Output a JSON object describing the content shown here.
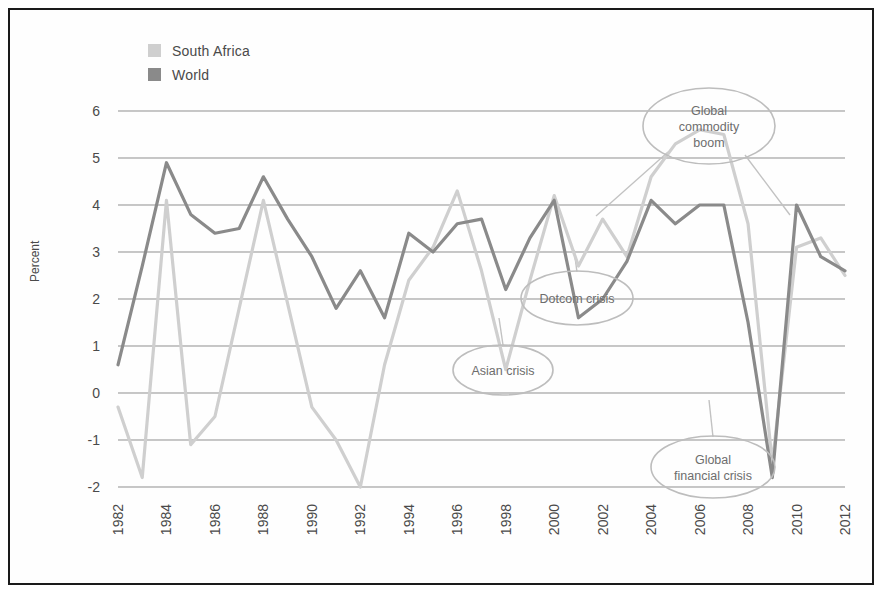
{
  "legend": {
    "items": [
      {
        "label": "South Africa",
        "color": "#cfcfcf"
      },
      {
        "label": "World",
        "color": "#8a8a8a"
      }
    ]
  },
  "axes": {
    "ylabel": "Percent",
    "yticks": [
      "6",
      "5",
      "4",
      "3",
      "2",
      "1",
      "0",
      "-1",
      "-2"
    ],
    "xticks": [
      "1982",
      "1984",
      "1986",
      "1988",
      "1990",
      "1992",
      "1994",
      "1996",
      "1998",
      "2000",
      "2002",
      "2004",
      "2006",
      "2008",
      "2010",
      "2012"
    ]
  },
  "annotations": [
    {
      "id": "global-commodity-boom",
      "lines": [
        "Global",
        "commodity",
        "boom"
      ],
      "cx": 709,
      "cy": 126,
      "rx": 66,
      "ry": 38
    },
    {
      "id": "dotcom-crisis",
      "lines": [
        "Dotcom crisis"
      ],
      "cx": 577,
      "cy": 298,
      "rx": 56,
      "ry": 27
    },
    {
      "id": "asian-crisis",
      "lines": [
        "Asian crisis"
      ],
      "cx": 503,
      "cy": 370,
      "rx": 50,
      "ry": 25
    },
    {
      "id": "global-financial-crisis",
      "lines": [
        "Global",
        "financial crisis"
      ],
      "cx": 713,
      "cy": 467,
      "rx": 62,
      "ry": 31
    }
  ],
  "chart_data": {
    "type": "line",
    "title": "",
    "xlabel": "",
    "ylabel": "Percent",
    "ylim": [
      -2,
      6
    ],
    "xlim": [
      1982,
      2012
    ],
    "grid": true,
    "legend_position": "top-left",
    "x": [
      1982,
      1983,
      1984,
      1985,
      1986,
      1987,
      1988,
      1989,
      1990,
      1991,
      1992,
      1993,
      1994,
      1995,
      1996,
      1997,
      1998,
      1999,
      2000,
      2001,
      2002,
      2003,
      2004,
      2005,
      2006,
      2007,
      2008,
      2009,
      2010,
      2011,
      2012
    ],
    "series": [
      {
        "name": "South Africa",
        "color": "#cfcfcf",
        "values": [
          -0.3,
          -1.8,
          4.1,
          -1.1,
          -0.5,
          1.8,
          4.1,
          1.9,
          -0.3,
          -1.0,
          -2.0,
          0.6,
          2.4,
          3.1,
          4.3,
          2.6,
          0.5,
          2.4,
          4.2,
          2.7,
          3.7,
          2.9,
          4.6,
          5.3,
          5.6,
          5.5,
          3.6,
          -1.5,
          3.1,
          3.3,
          2.5
        ]
      },
      {
        "name": "World",
        "color": "#8a8a8a",
        "values": [
          0.6,
          2.7,
          4.9,
          3.8,
          3.4,
          3.5,
          4.6,
          3.7,
          2.9,
          1.8,
          2.6,
          1.6,
          3.4,
          3.0,
          3.6,
          3.7,
          2.2,
          3.3,
          4.1,
          1.6,
          2.0,
          2.8,
          4.1,
          3.6,
          4.0,
          4.0,
          1.5,
          -1.8,
          4.0,
          2.9,
          2.6
        ]
      }
    ],
    "annotations": [
      {
        "label": "Asian crisis",
        "year": 1998
      },
      {
        "label": "Dotcom crisis",
        "year": 2001
      },
      {
        "label": "Global commodity boom",
        "year": 2007
      },
      {
        "label": "Global financial crisis",
        "year": 2009
      }
    ]
  }
}
